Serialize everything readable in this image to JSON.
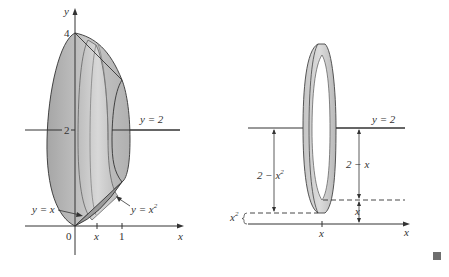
{
  "left_figure": {
    "axis_labels": {
      "y": "y",
      "x": "x"
    },
    "ticks": {
      "y4": "4",
      "y2": "2",
      "origin": "0",
      "x_mid": "x",
      "x1": "1"
    },
    "line_label": "y = 2",
    "curve_labels": {
      "line": "y = x",
      "parabola": "y = x",
      "parabola_exp": "2"
    }
  },
  "right_figure": {
    "line_label": "y = 2",
    "outer_radius_label": "2 − x",
    "outer_radius_exp": "2",
    "inner_radius_label": "2 − x",
    "lower_x_label": "x",
    "lower_x2_label": "x",
    "lower_x2_exp": "2",
    "axis_x_label": "x",
    "tick_x_label": "x"
  },
  "colors": {
    "solid_fill": "#b4b4b4",
    "solid_light": "#d2d2d2",
    "solid_dark": "#8c8c8c",
    "line": "#333333",
    "end_mark": "#6e6e6e"
  },
  "end_mark": "■"
}
